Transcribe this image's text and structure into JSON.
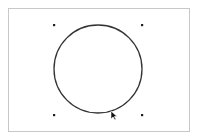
{
  "canvas": {
    "frame_color": "#c8c8c8",
    "background": "#ffffff"
  },
  "shape": {
    "type": "circle",
    "cx": 98,
    "cy": 69,
    "r": 44,
    "stroke": "#333333",
    "stroke_width": 1.3,
    "selected": true
  },
  "selection_handles": [
    {
      "x": 54,
      "y": 25
    },
    {
      "x": 142,
      "y": 25
    },
    {
      "x": 54,
      "y": 115
    },
    {
      "x": 142,
      "y": 115
    }
  ],
  "cursor": {
    "x": 111,
    "y": 111,
    "icon": "arrow-pointer-icon"
  }
}
